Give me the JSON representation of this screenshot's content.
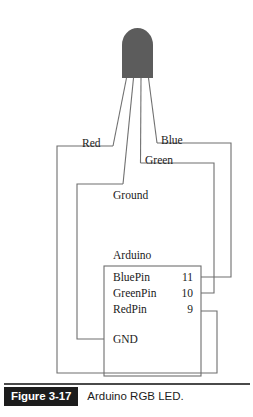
{
  "figure": {
    "number_label": "Figure 3-17",
    "caption": "Arduino RGB LED."
  },
  "colors": {
    "wire": "#6e6e6e",
    "led_body": "#5c5c5c",
    "caption_block_bg": "#1c1c1c",
    "caption_block_text": "#ffffff",
    "text": "#1a1a1a"
  },
  "diagram": {
    "component_label": "Arduino",
    "led_label": "RGB LED",
    "wire_labels": [
      {
        "id": "red",
        "label": "Red"
      },
      {
        "id": "blue",
        "label": "Blue"
      },
      {
        "id": "green",
        "label": "Green"
      },
      {
        "id": "ground",
        "label": "Ground"
      }
    ],
    "pins": [
      {
        "name": "BluePin",
        "number": "11"
      },
      {
        "name": "GreenPin",
        "number": "10"
      },
      {
        "name": "RedPin",
        "number": "9"
      }
    ],
    "ground_pin": {
      "name": "GND"
    }
  }
}
